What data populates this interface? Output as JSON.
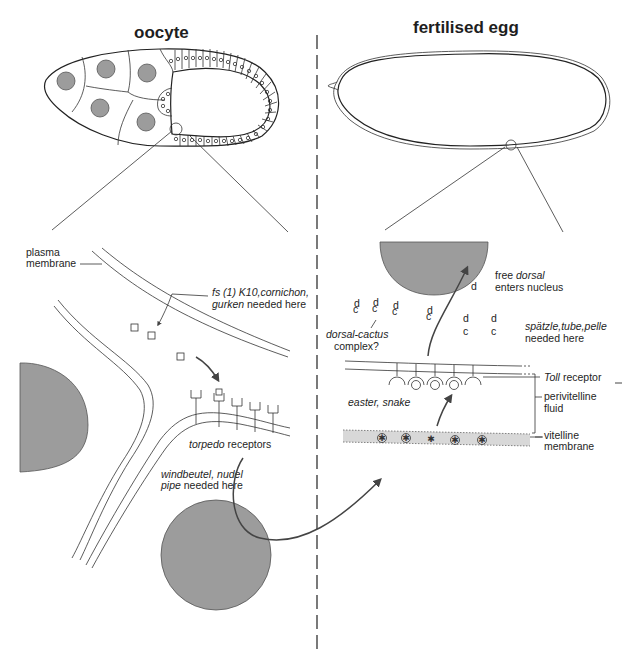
{
  "panels": {
    "left": {
      "title": "oocyte",
      "labels": {
        "plasma_membrane_1": "plasma",
        "plasma_membrane_2": "membrane",
        "k10_line1_italic": "fs (1) K10,cornichon,",
        "k10_line2_italic": "gurken",
        "k10_line2_rest": " needed here",
        "torpedo_italic": "torpedo",
        "torpedo_rest": " receptors",
        "windbeutel_line1": "windbeutel, nudel",
        "windbeutel_line2_italic": "pipe",
        "windbeutel_line2_rest": " needed here"
      }
    },
    "right": {
      "title": "fertilised egg",
      "labels": {
        "free_dorsal_1a": "free ",
        "free_dorsal_1b": "dorsal",
        "free_dorsal_2": "enters nucleus",
        "dorsal_cactus_1": "dorsal-cactus",
        "dorsal_cactus_2": "complex?",
        "spatzle_1": "spätzle,tube,pelle",
        "spatzle_2": "needed here",
        "toll_italic": "Toll",
        "toll_rest": " receptor",
        "perivitelline_1": "perivitelline",
        "perivitelline_2": "fluid",
        "easter_snake": "easter, snake",
        "vitelline_1": "vitelline",
        "vitelline_2": "membrane",
        "d_glyph": "d",
        "c_glyph": "c"
      }
    }
  },
  "colors": {
    "nucleus_fill": "#9c9c9c",
    "line": "#222222",
    "vitelline_band": "#d8d8d8"
  }
}
